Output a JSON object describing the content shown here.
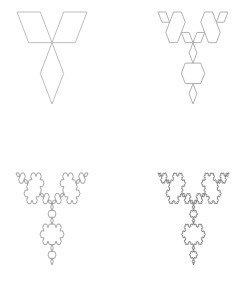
{
  "figure": {
    "width": 247,
    "height": 282,
    "background": "#ffffff",
    "panels": [
      {
        "name": "koch-snowflake-iteration-1",
        "iteration": 1,
        "bbox": {
          "x0": 17,
          "y0": 12,
          "x1": 87,
          "y1": 104
        },
        "stroke": "#b5b5b5"
      },
      {
        "name": "koch-snowflake-iteration-2",
        "iteration": 2,
        "bbox": {
          "x0": 158,
          "y0": 12,
          "x1": 228,
          "y1": 104
        },
        "stroke": "#a8a8a8"
      },
      {
        "name": "koch-snowflake-iteration-3",
        "iteration": 3,
        "bbox": {
          "x0": 16,
          "y0": 173,
          "x1": 88,
          "y1": 265
        },
        "stroke": "#9a9a9a"
      },
      {
        "name": "koch-snowflake-iteration-4",
        "iteration": 4,
        "bbox": {
          "x0": 158,
          "y0": 173,
          "x1": 229,
          "y1": 265
        },
        "stroke": "#7a7a7a"
      }
    ]
  }
}
